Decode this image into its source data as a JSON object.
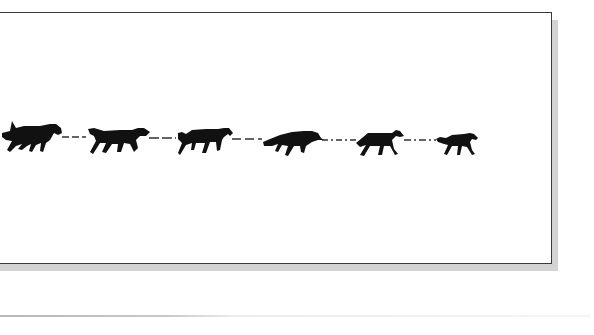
{
  "illustration": {
    "subject": "dog-team-silhouettes",
    "dog_count": 6,
    "frame_border_color": "#3a3a3a",
    "shadow_color": "#d4d4d4",
    "silhouette_color": "#111111",
    "gangline_color": "#333333"
  }
}
